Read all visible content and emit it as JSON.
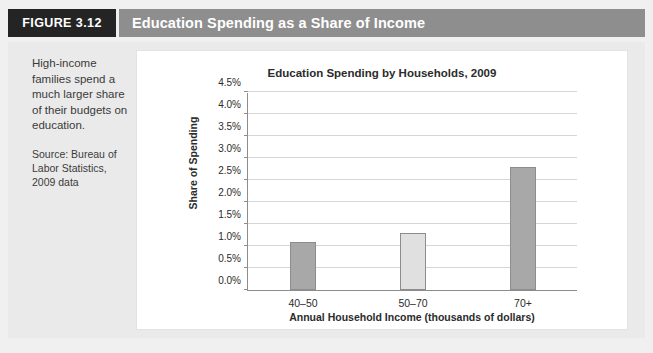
{
  "figure": {
    "badge_word": "FIGURE",
    "badge_number": "3.12",
    "title": "Education Spending as a Share of Income",
    "badge_bg": "#242424",
    "title_bar_bg": "#8e8e8e"
  },
  "caption": {
    "main": "High-income families spend a much larger share of their budgets on education.",
    "source": "Source: Bureau of Labor Statistics, 2009 data"
  },
  "chart_data": {
    "type": "bar",
    "title": "Education Spending by Households, 2009",
    "xlabel": "Annual Household Income (thousands of dollars)",
    "ylabel": "Share of Spending",
    "categories": [
      "40–50",
      "50–70",
      "70+"
    ],
    "values": [
      1.1,
      1.3,
      2.8
    ],
    "bar_colors": [
      "#a8a8a8",
      "#e0e0e0",
      "#a8a8a8"
    ],
    "ylim": [
      0,
      4.5
    ],
    "ytick_values": [
      0.0,
      0.5,
      1.0,
      1.5,
      2.0,
      2.5,
      3.0,
      3.5,
      4.0,
      4.5
    ],
    "ytick_labels": [
      "0.0%",
      "0.5%",
      "1.0%",
      "1.5%",
      "2.0%",
      "2.5%",
      "3.0%",
      "3.5%",
      "4.0%",
      "4.5%"
    ],
    "grid": true,
    "legend": "none",
    "value_suffix": "%"
  }
}
